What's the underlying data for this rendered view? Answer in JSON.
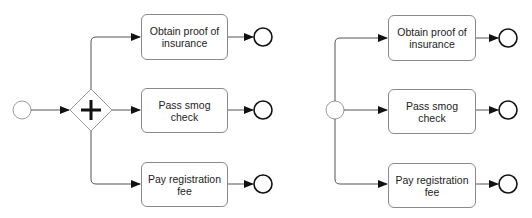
{
  "diagrams": [
    {
      "name": "with-parallel-gateway",
      "start_event": "start",
      "gateway": "parallel",
      "tasks": [
        {
          "label": "Obtain proof of insurance"
        },
        {
          "label": "Pass smog check"
        },
        {
          "label": "Pay registration fee"
        }
      ],
      "end_events": 3
    },
    {
      "name": "implicit-parallel-split",
      "start_event": "start",
      "gateway": null,
      "tasks": [
        {
          "label": "Obtain proof of insurance"
        },
        {
          "label": "Pass smog check"
        },
        {
          "label": "Pay registration fee"
        }
      ],
      "end_events": 3
    }
  ],
  "colors": {
    "line": "#555555",
    "start_stroke": "#9a9a9a",
    "end_stroke": "#111111",
    "task_border": "#8a8a8a",
    "text": "#222222"
  }
}
